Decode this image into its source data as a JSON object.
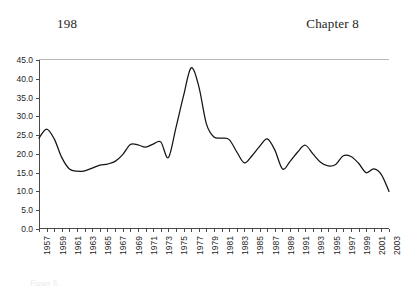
{
  "page": {
    "folio": "198",
    "chapter_label": "Chapter 8"
  },
  "caption": {
    "text": "Figure 8."
  },
  "chart_data": {
    "type": "line",
    "title": "",
    "xlabel": "",
    "ylabel": "",
    "grid": false,
    "legend": "none",
    "xlim": [
      1957,
      2003
    ],
    "ylim": [
      0.0,
      45.0
    ],
    "ytick_labels": [
      "45.0",
      "40.0",
      "35.0",
      "30.0",
      "25.0",
      "20.0",
      "15.0",
      "10.0",
      "5.0",
      "0.0"
    ],
    "ytick_values": [
      45.0,
      40.0,
      35.0,
      30.0,
      25.0,
      20.0,
      15.0,
      10.0,
      5.0,
      0.0
    ],
    "xtick_labels": [
      "1957",
      "1959",
      "1961",
      "1963",
      "1965",
      "1967",
      "1969",
      "1971",
      "1973",
      "1975",
      "1977",
      "1979",
      "1981",
      "1983",
      "1985",
      "1987",
      "1989",
      "1991",
      "1993",
      "1995",
      "1997",
      "1999",
      "2001",
      "2003"
    ],
    "xtick_values": [
      1957,
      1959,
      1961,
      1963,
      1965,
      1967,
      1969,
      1971,
      1973,
      1975,
      1977,
      1979,
      1981,
      1983,
      1985,
      1987,
      1989,
      1991,
      1993,
      1995,
      1997,
      1999,
      2001,
      2003
    ],
    "x": [
      1957,
      1958,
      1959,
      1960,
      1961,
      1962,
      1963,
      1964,
      1965,
      1966,
      1967,
      1968,
      1969,
      1970,
      1971,
      1972,
      1973,
      1974,
      1975,
      1976,
      1977,
      1978,
      1979,
      1980,
      1981,
      1982,
      1983,
      1984,
      1985,
      1986,
      1987,
      1988,
      1989,
      1990,
      1991,
      1992,
      1993,
      1994,
      1995,
      1996,
      1997,
      1998,
      1999,
      2000,
      2001,
      2002,
      2003
    ],
    "values": [
      24.2,
      26.6,
      24.0,
      19.0,
      16.0,
      15.4,
      15.5,
      16.2,
      17.0,
      17.3,
      18.0,
      19.8,
      22.5,
      22.4,
      21.8,
      22.6,
      23.2,
      19.0,
      27.0,
      35.5,
      42.9,
      38.0,
      28.0,
      24.5,
      24.2,
      23.8,
      20.5,
      17.6,
      19.5,
      22.0,
      24.0,
      21.0,
      16.0,
      18.0,
      20.5,
      22.3,
      20.0,
      17.8,
      16.8,
      17.2,
      19.5,
      19.3,
      17.5,
      15.0,
      16.0,
      14.5,
      10.0
    ],
    "series_color": "#141414"
  }
}
